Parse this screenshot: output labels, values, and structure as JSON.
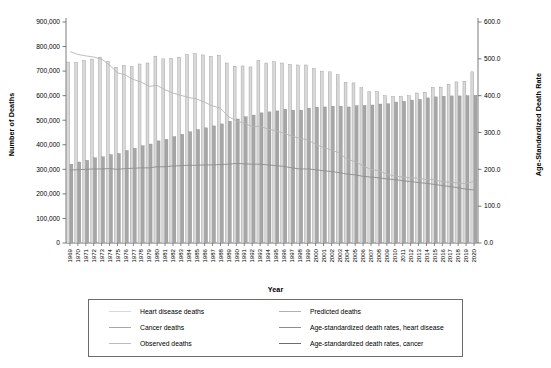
{
  "chart_data": {
    "type": "bar",
    "title": "",
    "xlabel": "Year",
    "ylabel": "Number of Deaths",
    "y2label": "Age-Standardized Death Rate",
    "ylim": [
      0,
      900000
    ],
    "y2lim": [
      0,
      600
    ],
    "yticks": [
      "0",
      "100,000",
      "200,000",
      "300,000",
      "400,000",
      "500,000",
      "600,000",
      "700,000",
      "800,000",
      "900,000"
    ],
    "y2ticks": [
      "0.0",
      "100.0",
      "200.0",
      "300.0",
      "400.0",
      "500.0",
      "600.0"
    ],
    "grid": false,
    "legend_position": "bottom",
    "categories": [
      "1969",
      "1970",
      "1971",
      "1972",
      "1973",
      "1974",
      "1975",
      "1976",
      "1977",
      "1978",
      "1979",
      "1980",
      "1981",
      "1982",
      "1983",
      "1984",
      "1985",
      "1986",
      "1987",
      "1988",
      "1989",
      "1990",
      "1991",
      "1992",
      "1993",
      "1994",
      "1995",
      "1996",
      "1997",
      "1998",
      "1999",
      "2000",
      "2001",
      "2002",
      "2003",
      "2004",
      "2005",
      "2006",
      "2007",
      "2008",
      "2009",
      "2010",
      "2011",
      "2012",
      "2013",
      "2014",
      "2015",
      "2016",
      "2017",
      "2018",
      "2019",
      "2020"
    ],
    "series": [
      {
        "name": "Heart disease deaths",
        "axis": "left",
        "type": "bar",
        "color": "#d9d9d9",
        "values": [
          737000,
          735000,
          743000,
          749000,
          757000,
          739000,
          716000,
          723000,
          718000,
          729000,
          733000,
          761000,
          750000,
          751000,
          757000,
          767000,
          771000,
          766000,
          760000,
          765000,
          733000,
          720000,
          721000,
          717000,
          743000,
          733000,
          738000,
          733000,
          727000,
          725000,
          725000,
          710000,
          700000,
          697000,
          685000,
          654000,
          652000,
          632000,
          616000,
          617000,
          600000,
          597000,
          597000,
          600000,
          611000,
          614000,
          634000,
          635000,
          647000,
          656000,
          659000,
          697000
        ]
      },
      {
        "name": "Cancer deaths",
        "axis": "left",
        "type": "bar",
        "color": "#a6a6a6",
        "values": [
          321000,
          330000,
          337000,
          347000,
          351000,
          360000,
          365000,
          377000,
          386000,
          396000,
          403000,
          416000,
          422000,
          433000,
          443000,
          453000,
          462000,
          469000,
          477000,
          485000,
          496000,
          505000,
          514000,
          521000,
          530000,
          534000,
          538000,
          545000,
          541000,
          541000,
          549000,
          553000,
          554000,
          557000,
          557000,
          554000,
          559000,
          560000,
          562000,
          566000,
          567000,
          574000,
          577000,
          582000,
          585000,
          591000,
          595000,
          598000,
          599000,
          599000,
          600000,
          602000
        ]
      },
      {
        "name": "Age-standardized death rates, heart disease",
        "axis": "right",
        "type": "line",
        "color": "#b5b5b5",
        "values": [
          520.0,
          512.0,
          508.0,
          505.0,
          499.0,
          483.0,
          462.0,
          456.0,
          444.0,
          437.0,
          425.0,
          428.0,
          416.0,
          407.0,
          401.0,
          395.0,
          391.0,
          382.0,
          372.0,
          366.0,
          343.0,
          332.0,
          325.0,
          316.0,
          317.0,
          309.0,
          305.0,
          298.0,
          290.0,
          284.0,
          280.0,
          268.0,
          259.0,
          253.0,
          244.0,
          227.0,
          221.0,
          209.0,
          200.0,
          196.0,
          187.0,
          182.0,
          179.0,
          177.0,
          176.0,
          172.0,
          172.0,
          166.0,
          165.0,
          163.0,
          161.0,
          168.0
        ]
      },
      {
        "name": "Age-standardized death rates, cancer",
        "axis": "right",
        "type": "line",
        "color": "#8c8c8c",
        "values": [
          198.0,
          199.0,
          200.0,
          201.0,
          201.0,
          202.0,
          200.0,
          202.0,
          203.0,
          204.0,
          204.0,
          207.0,
          207.0,
          209.0,
          210.0,
          211.0,
          211.0,
          212.0,
          212.0,
          213.0,
          214.0,
          216.0,
          215.0,
          214.0,
          214.0,
          212.0,
          210.0,
          208.0,
          204.0,
          201.0,
          201.0,
          199.0,
          196.0,
          194.0,
          191.0,
          187.0,
          185.0,
          181.0,
          179.0,
          177.0,
          174.0,
          172.0,
          169.0,
          167.0,
          164.0,
          162.0,
          159.0,
          156.0,
          153.0,
          150.0,
          146.0,
          144.0
        ]
      }
    ],
    "legend": [
      {
        "label": "Heart disease deaths",
        "color": "#d9d9d9"
      },
      {
        "label": "Predicted deaths",
        "color": "#b0b0b0"
      },
      {
        "label": "Cancer deaths",
        "color": "#a6a6a6"
      },
      {
        "label": "Age-standardized death rates, heart disease",
        "color": "#8f8f8f"
      },
      {
        "label": "Observed deaths",
        "color": "#bdbdbd"
      },
      {
        "label": "Age-standardized death rates, cancer",
        "color": "#6e6e6e"
      }
    ]
  },
  "axes": {
    "left_title": "Number of Deaths",
    "right_title": "Age-Standardized Death Rate",
    "x_title": "Year"
  },
  "legend": {
    "item_0": "Heart disease deaths",
    "item_1": "Predicted deaths",
    "item_2": "Cancer deaths",
    "item_3": "Age-standardized death rates, heart disease",
    "item_4": "Observed deaths",
    "item_5": "Age-standardized death rates, cancer"
  }
}
